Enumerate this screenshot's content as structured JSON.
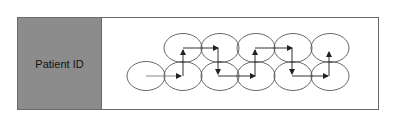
{
  "panel": {
    "label": "Patient ID",
    "fill": "#8c8c8c"
  },
  "diagram": {
    "ellipse_rx": 19,
    "ellipse_ry": 14.5,
    "top_row_y": 48,
    "bottom_row_y": 76,
    "top_row_x": [
      183,
      220,
      256,
      293,
      330
    ],
    "bottom_row_x": [
      146,
      183,
      220,
      256,
      293,
      330
    ],
    "path_points": [
      [
        146,
        76
      ],
      [
        181,
        76
      ],
      [
        183,
        76
      ],
      [
        183,
        50
      ],
      [
        183,
        48
      ],
      [
        218,
        48
      ],
      [
        218,
        48
      ],
      [
        218,
        74
      ],
      [
        218,
        76
      ],
      [
        255,
        76
      ],
      [
        255,
        76
      ],
      [
        255,
        50
      ],
      [
        255,
        48
      ],
      [
        292,
        48
      ],
      [
        292,
        48
      ],
      [
        292,
        74
      ],
      [
        292,
        76
      ],
      [
        328,
        76
      ],
      [
        329,
        76
      ],
      [
        329,
        52
      ]
    ],
    "arrows": [
      {
        "from": [
          146,
          76
        ],
        "to": [
          181,
          76
        ]
      },
      {
        "from": [
          183,
          76
        ],
        "to": [
          183,
          50
        ]
      },
      {
        "from": [
          183,
          48
        ],
        "to": [
          218,
          48
        ]
      },
      {
        "from": [
          218,
          48
        ],
        "to": [
          218,
          74
        ]
      },
      {
        "from": [
          218,
          76
        ],
        "to": [
          255,
          76
        ]
      },
      {
        "from": [
          255,
          76
        ],
        "to": [
          255,
          50
        ]
      },
      {
        "from": [
          255,
          48
        ],
        "to": [
          292,
          48
        ]
      },
      {
        "from": [
          292,
          48
        ],
        "to": [
          292,
          74
        ]
      },
      {
        "from": [
          292,
          76
        ],
        "to": [
          328,
          76
        ]
      },
      {
        "from": [
          329,
          76
        ],
        "to": [
          329,
          52
        ]
      }
    ],
    "stroke": "#555555",
    "arrow_color": "#333333"
  }
}
